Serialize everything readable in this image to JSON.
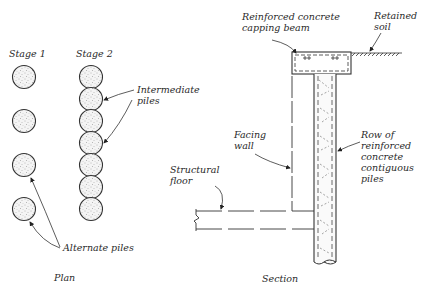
{
  "diagram": {
    "plan": {
      "title": "Plan",
      "stage1_label": "Stage 1",
      "stage2_label": "Stage 2",
      "stage1_pile_count": 4,
      "stage2_pile_count": 7,
      "intermediate_piles_label": "Intermediate\npiles",
      "alternate_piles_label": "Alternate piles"
    },
    "section": {
      "title": "Section",
      "capping_beam_label": "Reinforced concrete\ncapping beam",
      "retained_soil_label": "Retained\nsoil",
      "facing_wall_label": "Facing\nwall",
      "structural_floor_label": "Structural\nfloor",
      "piles_label": "Row of\nreinforced\nconcrete\ncontiguous\npiles"
    },
    "colors": {
      "line": "#333333",
      "pile_fill": "#f2f2f2",
      "stipple": "#777777"
    }
  }
}
